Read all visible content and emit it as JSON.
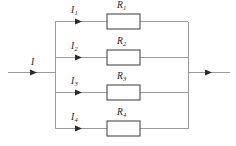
{
  "figure": {
    "background_color": "#ffffff",
    "wire_color": "#9a9a9a",
    "resistor_outline_color": "#4a4a4a",
    "arrow_color": "#2b2b2b",
    "label_color": "#1a1a1a"
  },
  "main_current": {
    "symbol": "I",
    "subscript": "",
    "direction": "right"
  },
  "output_current": {
    "symbol": "",
    "direction": "right"
  },
  "branches": [
    {
      "current_symbol": "I",
      "current_subscript": "1",
      "resistor_symbol": "R",
      "resistor_subscript": "1",
      "y": 21
    },
    {
      "current_symbol": "I",
      "current_subscript": "2",
      "resistor_symbol": "R",
      "resistor_subscript": "2",
      "y": 57
    },
    {
      "current_symbol": "I",
      "current_subscript": "3",
      "resistor_symbol": "R",
      "resistor_subscript": "3",
      "y": 92
    },
    {
      "current_symbol": "I",
      "current_subscript": "4",
      "resistor_symbol": "R",
      "resistor_subscript": "4",
      "y": 128
    }
  ]
}
